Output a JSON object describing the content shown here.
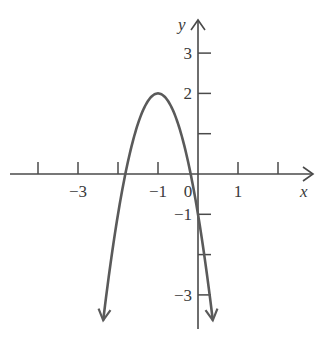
{
  "chart_data": {
    "type": "line",
    "title": "",
    "function": "y = -3(x + 1)^2 + 2",
    "vertex": [
      -1,
      2
    ],
    "xlabel": "x",
    "ylabel": "y",
    "xlim": [
      -4,
      2.9
    ],
    "ylim": [
      -3.85,
      3.5
    ],
    "x_ticks": [
      -4,
      -3,
      -2,
      -1,
      0,
      1,
      2
    ],
    "x_tick_labels": [
      {
        "value": -3,
        "label": "−3"
      },
      {
        "value": -1,
        "label": "−1"
      },
      {
        "value": 0,
        "label": "0"
      },
      {
        "value": 1,
        "label": "1"
      }
    ],
    "y_ticks": [
      3,
      2,
      1,
      -1,
      -2,
      -3
    ],
    "y_tick_labels": [
      {
        "value": 3,
        "label": "3"
      },
      {
        "value": 2,
        "label": "2"
      },
      {
        "value": -1,
        "label": "−1"
      },
      {
        "value": -3,
        "label": "−3"
      }
    ],
    "curve_x_range": [
      -2.37,
      0.37
    ],
    "series": [
      {
        "name": "parabola",
        "x": [
          -2.37,
          -2.0,
          -1.5,
          -1.0,
          -0.5,
          0.0,
          0.37
        ],
        "y": [
          -3.63,
          -1.0,
          1.25,
          2.0,
          1.25,
          -1.0,
          -3.63
        ]
      }
    ],
    "grid": false,
    "legend": null,
    "colors": {
      "curve": "#5a5a5a",
      "axis": "#4a4a4a",
      "text": "#3a3a3a"
    }
  }
}
